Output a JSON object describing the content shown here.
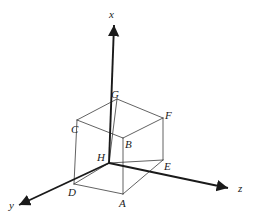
{
  "figure": {
    "stroke_color": "#3a3a3a",
    "axis_color": "#1a1a1a",
    "background_color": "#ffffff",
    "axes": [
      {
        "name": "x",
        "label": "x",
        "label_x": 109,
        "label_y": 9,
        "from_x": 109,
        "from_y": 163,
        "to_x": 114,
        "to_y": 25
      },
      {
        "name": "y",
        "label": "y",
        "label_x": 9,
        "label_y": 200,
        "from_x": 109,
        "from_y": 163,
        "to_x": 19,
        "to_y": 205
      },
      {
        "name": "z",
        "label": "z",
        "label_x": 238,
        "label_y": 183,
        "from_x": 109,
        "from_y": 163,
        "to_x": 228,
        "to_y": 188
      }
    ],
    "vertices": [
      {
        "name": "A",
        "label": "A",
        "x": 123,
        "y": 194,
        "label_x": 119,
        "label_y": 198
      },
      {
        "name": "B",
        "label": "B",
        "x": 123,
        "y": 138,
        "label_x": 125,
        "label_y": 139
      },
      {
        "name": "C",
        "label": "C",
        "x": 77,
        "y": 120,
        "label_x": 71,
        "label_y": 124
      },
      {
        "name": "D",
        "label": "D",
        "x": 74,
        "y": 184,
        "label_x": 68,
        "label_y": 187
      },
      {
        "name": "E",
        "label": "E",
        "x": 163,
        "y": 160,
        "label_x": 164,
        "label_y": 161
      },
      {
        "name": "F",
        "label": "F",
        "x": 163,
        "y": 118,
        "label_x": 165,
        "label_y": 110
      },
      {
        "name": "G",
        "label": "G",
        "x": 117,
        "y": 99,
        "label_x": 111,
        "label_y": 89
      },
      {
        "name": "H",
        "label": "H",
        "x": 109,
        "y": 163,
        "label_x": 97,
        "label_y": 152
      }
    ],
    "edges": [
      {
        "name": "edge-D-A",
        "x1": 74,
        "y1": 184,
        "x2": 123,
        "y2": 194,
        "style": "solid"
      },
      {
        "name": "edge-A-E",
        "x1": 123,
        "y1": 194,
        "x2": 163,
        "y2": 160,
        "style": "solid"
      },
      {
        "name": "edge-D-H",
        "x1": 74,
        "y1": 184,
        "x2": 109,
        "y2": 163,
        "style": "solid"
      },
      {
        "name": "edge-H-E",
        "x1": 109,
        "y1": 163,
        "x2": 163,
        "y2": 160,
        "style": "solid"
      },
      {
        "name": "edge-C-G",
        "x1": 77,
        "y1": 120,
        "x2": 117,
        "y2": 99,
        "style": "solid"
      },
      {
        "name": "edge-G-F",
        "x1": 117,
        "y1": 99,
        "x2": 163,
        "y2": 118,
        "style": "solid"
      },
      {
        "name": "edge-C-B",
        "x1": 77,
        "y1": 120,
        "x2": 123,
        "y2": 138,
        "style": "solid"
      },
      {
        "name": "edge-B-F",
        "x1": 123,
        "y1": 138,
        "x2": 163,
        "y2": 118,
        "style": "solid"
      },
      {
        "name": "edge-C-D",
        "x1": 77,
        "y1": 120,
        "x2": 74,
        "y2": 184,
        "style": "solid"
      },
      {
        "name": "edge-G-H",
        "x1": 117,
        "y1": 99,
        "x2": 109,
        "y2": 163,
        "style": "solid"
      },
      {
        "name": "edge-F-E",
        "x1": 163,
        "y1": 118,
        "x2": 163,
        "y2": 160,
        "style": "solid"
      },
      {
        "name": "edge-B-A",
        "x1": 123,
        "y1": 138,
        "x2": 123,
        "y2": 194,
        "style": "solid"
      }
    ]
  }
}
